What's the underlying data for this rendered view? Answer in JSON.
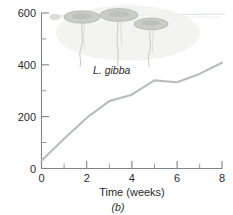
{
  "panel": {
    "label": "(b)"
  },
  "inset": {
    "species_label": "L. gibba",
    "icon_names": [
      "duckweed-frond-icon",
      "duckweed-root-icon"
    ],
    "frond_color": "#c9cdc6",
    "root_color": "#bfc2bd"
  },
  "chart_data": {
    "type": "line",
    "title": "",
    "subtitle": "",
    "xlabel": "Time (weeks)",
    "ylabel": "",
    "xlim": [
      0,
      8
    ],
    "ylim": [
      0,
      600
    ],
    "grid": false,
    "legend": null,
    "line_color": "#b9bcbe",
    "axis_color": "#808285",
    "x_major_ticks": [
      0,
      2,
      4,
      6,
      8
    ],
    "x_minor_ticks": [
      1,
      3,
      5,
      7
    ],
    "x_tick_labels": [
      "0",
      "2",
      "4",
      "6",
      "8"
    ],
    "y_major_ticks": [
      0,
      200,
      400,
      600
    ],
    "y_minor_ticks": [
      100,
      300,
      500
    ],
    "y_tick_labels": [
      "0",
      "200",
      "400",
      "600"
    ],
    "series": [
      {
        "name": "L. gibba",
        "x": [
          0,
          1,
          2,
          3,
          4,
          5,
          6,
          7,
          8
        ],
        "values": [
          30,
          115,
          195,
          260,
          285,
          340,
          333,
          365,
          408
        ]
      }
    ]
  }
}
